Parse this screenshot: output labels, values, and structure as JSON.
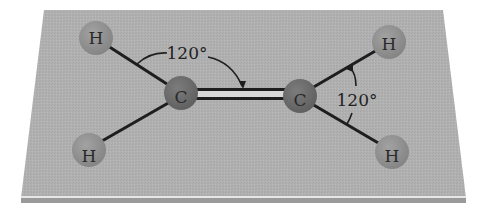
{
  "diagram": {
    "colors": {
      "background": "#ffffff",
      "plane": "#b0b0b0",
      "plane_edge_light": "#e6e6e6",
      "plane_bottom_strip": "#9a9a9a",
      "carbon": "#6e6e6e",
      "hydrogen": "#8f8f8f",
      "bond": "#1e1e1e",
      "label": "#222222"
    },
    "atoms": [
      {
        "id": "H1",
        "label": "H",
        "element": "hydrogen",
        "x": 96,
        "y": 38
      },
      {
        "id": "H2",
        "label": "H",
        "element": "hydrogen",
        "x": 89,
        "y": 150
      },
      {
        "id": "C1",
        "label": "C",
        "element": "carbon",
        "x": 181,
        "y": 93
      },
      {
        "id": "C2",
        "label": "C",
        "element": "carbon",
        "x": 300,
        "y": 96
      },
      {
        "id": "H3",
        "label": "H",
        "element": "hydrogen",
        "x": 389,
        "y": 42
      },
      {
        "id": "H4",
        "label": "H",
        "element": "hydrogen",
        "x": 392,
        "y": 152
      }
    ],
    "bonds": [
      {
        "from": "H1",
        "to": "C1",
        "order": 1
      },
      {
        "from": "H2",
        "to": "C1",
        "order": 1
      },
      {
        "from": "C1",
        "to": "C2",
        "order": 2
      },
      {
        "from": "C2",
        "to": "H3",
        "order": 1
      },
      {
        "from": "C2",
        "to": "H4",
        "order": 1
      }
    ],
    "angle_labels": [
      {
        "id": "angle-left",
        "text": "120°",
        "x": 185,
        "y": 59,
        "between": [
          "H1-C1",
          "C1=C2"
        ]
      },
      {
        "id": "angle-right",
        "text": "120°",
        "x": 352,
        "y": 106,
        "between": [
          "C2-H3",
          "C2-H4"
        ]
      }
    ]
  }
}
